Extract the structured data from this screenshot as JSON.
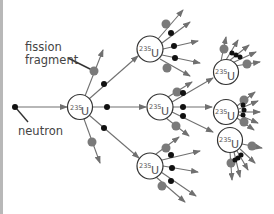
{
  "diagram": {
    "labels": {
      "fragment_line1": "fission",
      "fragment_line2": "fragment",
      "neutron": "neutron"
    },
    "nucleus": {
      "mass_number": "235",
      "symbol": "U"
    },
    "colors": {
      "line": "#707070",
      "neutron": "#111111",
      "fragment": "#7a7a7a",
      "nucleus_stroke": "#333333",
      "text": "#444444"
    },
    "nuclei": [
      {
        "id": "U1",
        "generation": 1,
        "x": 80,
        "y": 107
      },
      {
        "id": "U2",
        "generation": 2,
        "x": 150,
        "y": 49
      },
      {
        "id": "U3",
        "generation": 2,
        "x": 160,
        "y": 107
      },
      {
        "id": "U4",
        "generation": 2,
        "x": 150,
        "y": 166
      },
      {
        "id": "U5",
        "generation": 3,
        "x": 226,
        "y": 72
      },
      {
        "id": "U6",
        "generation": 3,
        "x": 226,
        "y": 112
      },
      {
        "id": "U7",
        "generation": 3,
        "x": 230,
        "y": 140
      }
    ]
  }
}
